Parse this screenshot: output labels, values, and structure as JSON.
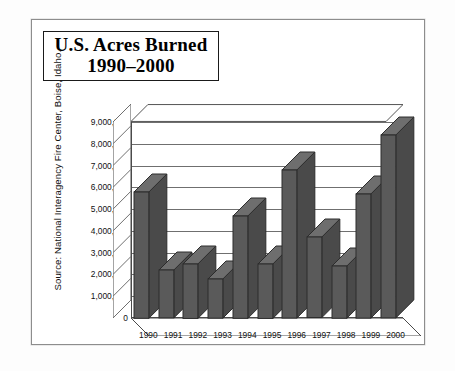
{
  "figure": {
    "title_line1": "U.S. Acres Burned",
    "title_line2": "1990–2000",
    "source": "Source: National Interagency Fire Center, Boise, Idaho.",
    "bar_color": "#5a5a5a",
    "bar_side_color": "#4a4a4a",
    "bar_top_color": "#6e6e6e",
    "outline_color": "#2c2c2c",
    "gridline_color": "#6f6f6f",
    "axis_color": "#4a4a4a"
  },
  "chart_data": {
    "type": "bar",
    "title": "U.S. Acres Burned 1990–2000",
    "xlabel": "",
    "ylabel": "",
    "ylim": [
      0,
      9000000
    ],
    "ytick_step": 1000000,
    "grid": true,
    "legend": false,
    "three_d": true,
    "categories": [
      "1990",
      "1991",
      "1992",
      "1993",
      "1994",
      "1995",
      "1996",
      "1997",
      "1998",
      "1999",
      "2000"
    ],
    "values": [
      5800000,
      2200000,
      2500000,
      1800000,
      4700000,
      2500000,
      6800000,
      3700000,
      2400000,
      5700000,
      8400000
    ],
    "ytick_labels": [
      "9,000,000",
      "8,000,000",
      "7,000,000",
      "6,000,000",
      "5,000,000",
      "4,000,000",
      "3,000,000",
      "2,000,000",
      "1,000,000",
      "0"
    ],
    "ytick_values": [
      9000000,
      8000000,
      7000000,
      6000000,
      5000000,
      4000000,
      3000000,
      2000000,
      1000000,
      0
    ],
    "annotations": [
      "Source: National Interagency Fire Center, Boise, Idaho."
    ]
  }
}
